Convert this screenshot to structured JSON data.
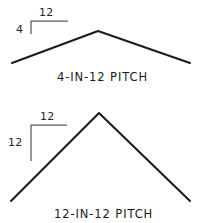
{
  "drawing": {
    "title_visible": false,
    "background_color": "#ffffff",
    "ink_color": "#1c1c1c",
    "bracket_color": "#5d5d5d"
  },
  "figures": [
    {
      "id": "four-in-twelve",
      "caption": "4-IN-12 PITCH",
      "rise_label": "4",
      "run_label": "12",
      "rise": 4,
      "run": 12,
      "apex": {
        "x": 98,
        "y": 31
      },
      "left_eave": {
        "x": 12,
        "y": 63
      },
      "right_eave": {
        "x": 190,
        "y": 63
      },
      "bracket": {
        "corner": {
          "x": 31,
          "y": 21
        },
        "horizontal_end": {
          "x": 68,
          "y": 21
        },
        "vertical_end": {
          "x": 31,
          "y": 34
        }
      }
    },
    {
      "id": "twelve-in-twelve",
      "caption": "12-IN-12 PITCH",
      "rise_label": "12",
      "run_label": "12",
      "rise": 12,
      "run": 12,
      "apex": {
        "x": 99,
        "y": 113
      },
      "left_eave": {
        "x": 11,
        "y": 201
      },
      "right_eave": {
        "x": 190,
        "y": 201
      },
      "bracket": {
        "corner": {
          "x": 31,
          "y": 125
        },
        "horizontal_end": {
          "x": 67,
          "y": 125
        },
        "vertical_end": {
          "x": 31,
          "y": 161
        }
      }
    }
  ],
  "labels": {
    "top_run": "12",
    "top_rise": "4",
    "top_caption": "4-IN-12 PITCH",
    "bottom_run": "12",
    "bottom_rise": "12",
    "bottom_caption": "12-IN-12 PITCH"
  }
}
